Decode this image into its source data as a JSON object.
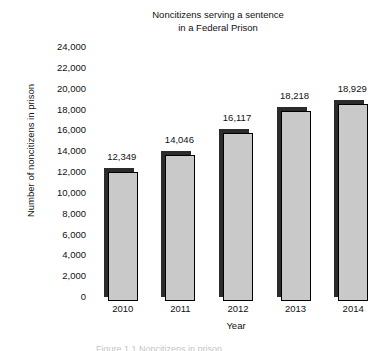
{
  "chart_data": {
    "type": "bar",
    "title": "Noncitizens serving a sentence in a Federal Prison",
    "title_lines": [
      "Noncitizens serving a sentence",
      "in a Federal Prison"
    ],
    "xlabel": "Year",
    "ylabel": "Number of noncitizens in prison",
    "categories": [
      "2010",
      "2011",
      "2012",
      "2013",
      "2014"
    ],
    "values": [
      12349,
      14046,
      16117,
      18218,
      18929
    ],
    "value_labels": [
      "12,349",
      "14,046",
      "16,117",
      "18,218",
      "18,929"
    ],
    "ylim": [
      0,
      24000
    ],
    "ytick_values": [
      24000,
      22000,
      20000,
      18000,
      16000,
      14000,
      12000,
      10000,
      8000,
      6000,
      4000,
      2000,
      0
    ],
    "ytick_labels": [
      "24,000",
      "22,000",
      "20,000",
      "18,000",
      "16,000",
      "14,000",
      "12,000",
      "10,000",
      "8,000",
      "6,000",
      "4,000",
      "2,000",
      "0"
    ],
    "grid": false,
    "legend": false,
    "bar_fill_color": "#c9c9c9",
    "bar_border_color": "#000000",
    "bar_shadow_color": "#2b2b2b",
    "background_color": "#ffffff",
    "text_color": "#111111"
  },
  "bottom_caption": "Figure 1.1 Noncitizens in prison"
}
